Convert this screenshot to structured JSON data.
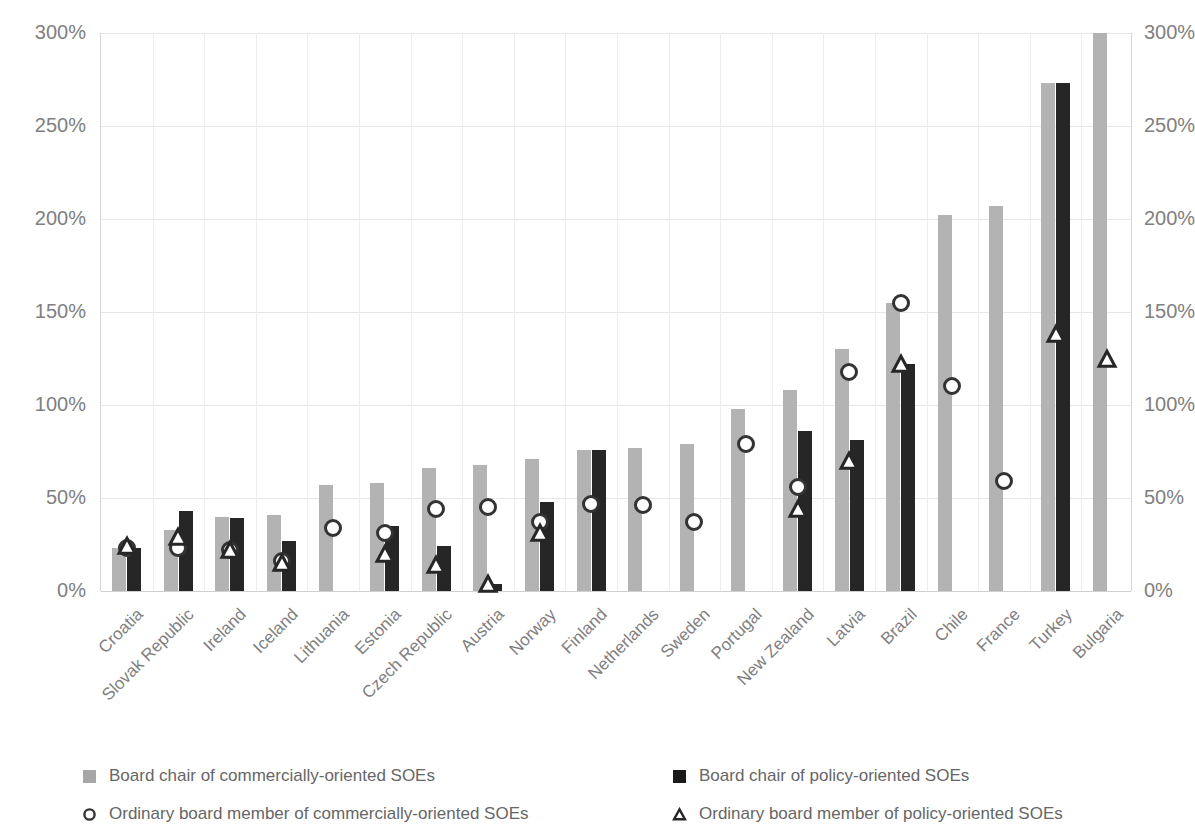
{
  "chart_data": {
    "type": "bar",
    "title": "",
    "subtitle": "",
    "xlabel": "",
    "ylabel": "",
    "ylim": [
      0,
      300
    ],
    "ytick_values": [
      0,
      50,
      100,
      150,
      200,
      250,
      300
    ],
    "ytick_labels": [
      "0%",
      "50%",
      "100%",
      "150%",
      "200%",
      "250%",
      "300%"
    ],
    "y_axis_right_labels": [
      "0%",
      "50%",
      "100%",
      "150%",
      "200%",
      "250%",
      "300%"
    ],
    "grid": true,
    "legend_position": "bottom",
    "categories": [
      "Croatia",
      "Slovak Republic",
      "Ireland",
      "Iceland",
      "Lithuania",
      "Estonia",
      "Czech Republic",
      "Austria",
      "Norway",
      "Finland",
      "Netherlands",
      "Sweden",
      "Portugal",
      "New Zealand",
      "Latvia",
      "Brazil",
      "Chile",
      "France",
      "Turkey",
      "Bulgaria"
    ],
    "series": [
      {
        "name": "Board chair of commercially-oriented SOEs",
        "kind": "bar",
        "color": "#b3b3b3",
        "values": [
          23,
          33,
          40,
          41,
          57,
          58,
          66,
          68,
          71,
          76,
          77,
          79,
          98,
          108,
          130,
          155,
          202,
          207,
          273,
          300
        ]
      },
      {
        "name": "Board chair of policy-oriented SOEs",
        "kind": "bar",
        "color": "#262626",
        "values": [
          23,
          43,
          39,
          27,
          null,
          35,
          24,
          4,
          48,
          76,
          null,
          null,
          null,
          86,
          81,
          122,
          null,
          null,
          273,
          null
        ]
      },
      {
        "name": "Ordinary board member of commercially-oriented SOEs",
        "kind": "marker-circle",
        "color": "#ffffff",
        "values": [
          23,
          23,
          22,
          16,
          34,
          31,
          44,
          45,
          37,
          47,
          46,
          37,
          79,
          56,
          118,
          155,
          110,
          59,
          null,
          null
        ]
      },
      {
        "name": "Ordinary board member of policy-oriented SOEs",
        "kind": "marker-triangle",
        "color": "#ffffff",
        "values": [
          24,
          29,
          22,
          15,
          null,
          20,
          14,
          4,
          31,
          null,
          null,
          null,
          null,
          44,
          70,
          122,
          null,
          null,
          138,
          125
        ]
      }
    ]
  },
  "legend": {
    "items": [
      {
        "label": "Board chair of commercially-oriented SOEs",
        "marker": "square-light"
      },
      {
        "label": "Board chair of policy-oriented SOEs",
        "marker": "square-dark"
      },
      {
        "label": "Ordinary board member of commercially-oriented SOEs",
        "marker": "circle-open"
      },
      {
        "label": "Ordinary board member of policy-oriented SOEs",
        "marker": "triangle-open"
      }
    ]
  },
  "colors": {
    "bar_light": "#b3b3b3",
    "bar_dark": "#262626",
    "marker_fill": "#ffffff",
    "marker_stroke": "#262626",
    "grid": "#e6e6e6",
    "text": "#7f7f7f",
    "background": "#ffffff"
  }
}
